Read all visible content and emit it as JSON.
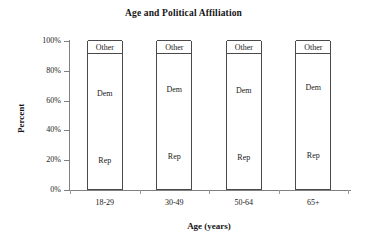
{
  "chart_data": {
    "type": "bar",
    "subtype": "stacked-percent-column",
    "title": "Age and Political Affiliation",
    "xlabel": "Age (years)",
    "ylabel": "Percent",
    "categories": [
      "18-29",
      "30-49",
      "50-64",
      "65+"
    ],
    "series": [
      {
        "name": "Rep",
        "values": [
          39,
          44,
          43,
          46
        ]
      },
      {
        "name": "Dem",
        "values": [
          52,
          47,
          48,
          45
        ]
      },
      {
        "name": "Other",
        "values": [
          9,
          9,
          9,
          9
        ]
      }
    ],
    "ylim": [
      0,
      100
    ],
    "yticks": [
      0,
      20,
      40,
      60,
      80,
      100
    ],
    "ytick_labels": [
      "0%",
      "20%",
      "40%",
      "60%",
      "80%",
      "100%"
    ],
    "grid": false,
    "legend": "none",
    "stack_order_bottom_to_top": [
      "Rep",
      "Dem",
      "Other"
    ],
    "segment_labels_inside_bars": true,
    "bar_fill_color": "#ffffff",
    "bar_outline_color": "#4a4a4a",
    "axis_color": "#808080",
    "text_color": "#1a1a1a"
  }
}
